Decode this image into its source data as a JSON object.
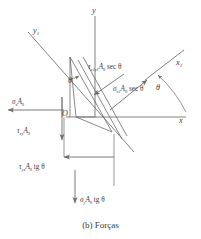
{
  "figure": {
    "caption": "(b) Forças",
    "stroke_color": "#6b6b6b",
    "text_color": "#3a3a3a",
    "background": "#ffffff",
    "width": 201,
    "height": 239
  },
  "axes": [
    {
      "name": "y-axis",
      "label": "y",
      "sub": ""
    },
    {
      "name": "y1-axis",
      "label": "y",
      "sub": "1"
    },
    {
      "name": "x-axis",
      "label": "x",
      "sub": ""
    },
    {
      "name": "x1-axis",
      "label": "x",
      "sub": "1"
    }
  ],
  "origin": {
    "label": "O"
  },
  "angles": [
    {
      "name": "wedge-angle",
      "label": "θ"
    },
    {
      "name": "axis-angle",
      "label": "θ"
    }
  ],
  "forces": [
    {
      "name": "tau-x1y1-force",
      "symbol": "τ",
      "sub": "x1y1",
      "rest": "A0 sec θ",
      "direction": "up-left-normal-to-incline"
    },
    {
      "name": "sigma-x1-force",
      "symbol": "σ",
      "sub": "x1",
      "rest": "A0 sec θ",
      "direction": "up-right-along-x1"
    },
    {
      "name": "sigma-x-force",
      "symbol": "σ",
      "sub": "x",
      "rest": "A0",
      "direction": "left"
    },
    {
      "name": "tau-xy-force",
      "symbol": "τ",
      "sub": "xy",
      "rest": "A0",
      "direction": "down"
    },
    {
      "name": "tau-yx-force",
      "symbol": "τ",
      "sub": "yx",
      "rest": "A0 tg θ",
      "direction": "left"
    },
    {
      "name": "sigma-y-force",
      "symbol": "σ",
      "sub": "y",
      "rest": "A0 tg θ",
      "direction": "down"
    }
  ],
  "labels": {
    "y": "y",
    "y1_base": "y",
    "y1_sub": "1",
    "x": "x",
    "x1_base": "x",
    "x1_sub": "1",
    "origin": "O",
    "theta_wedge": "θ",
    "theta_axis": "θ",
    "tau_sym": "τ",
    "sigma_sym": "σ",
    "A0_base": "A",
    "A0_sub": "0",
    "sub_x1y1": "x1y1",
    "sub_x1": "x1",
    "sub_x": "x",
    "sub_xy": "xy",
    "sub_yx": "yx",
    "sub_y": "y",
    "sec_theta": "sec θ",
    "tg_theta": "tg θ",
    "caption": "(b) Forças"
  }
}
